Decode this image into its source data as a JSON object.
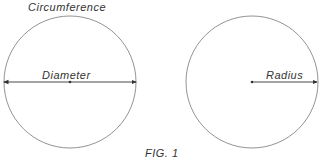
{
  "figure": {
    "caption": "FIG. 1",
    "stroke_color": "#555555",
    "left_circle": {
      "top_label": "Circumference",
      "line_label": "Diameter"
    },
    "right_circle": {
      "line_label": "Radius"
    }
  }
}
